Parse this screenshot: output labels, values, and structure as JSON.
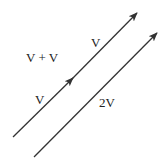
{
  "diagram": {
    "labels": {
      "sum_expression": "V + V",
      "first_vector": "V",
      "second_vector": "V",
      "result_vector": "2V"
    },
    "vectors": [
      {
        "name": "V (first)",
        "from": [
          13,
          137
        ],
        "to": [
          73,
          78
        ]
      },
      {
        "name": "V (second)",
        "from": [
          73,
          78
        ],
        "to": [
          137,
          13
        ]
      },
      {
        "name": "2V",
        "from": [
          34,
          157
        ],
        "to": [
          157,
          33
        ]
      }
    ],
    "colors": {
      "line": "#333333",
      "text": "#222222"
    }
  }
}
